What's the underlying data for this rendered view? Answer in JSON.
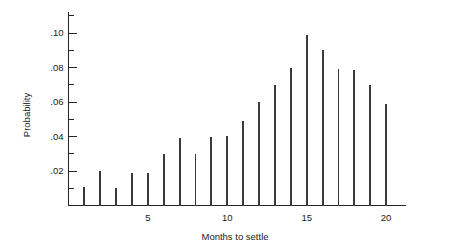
{
  "chart_data": {
    "type": "bar",
    "title": "",
    "subtitle": "",
    "xlabel": "Months to settle",
    "ylabel": "Probability",
    "categories": [
      1,
      2,
      3,
      4,
      5,
      6,
      7,
      8,
      9,
      10,
      11,
      12,
      13,
      14,
      15,
      16,
      17,
      18,
      19,
      20
    ],
    "values": [
      0.011,
      0.02,
      0.01,
      0.019,
      0.019,
      0.03,
      0.039,
      0.03,
      0.04,
      0.0405,
      0.049,
      0.06,
      0.07,
      0.08,
      0.099,
      0.09,
      0.079,
      0.0785,
      0.07,
      0.059
    ],
    "xlim": [
      0.3,
      21.2
    ],
    "ylim": [
      0,
      0.112
    ],
    "xticks": [
      1,
      2,
      3,
      4,
      5,
      6,
      7,
      8,
      9,
      10,
      11,
      12,
      13,
      14,
      15,
      16,
      17,
      18,
      19,
      20
    ],
    "xtick_labels": [
      {
        "value": 5,
        "label": "5"
      },
      {
        "value": 10,
        "label": "10"
      },
      {
        "value": 15,
        "label": "15"
      },
      {
        "value": 20,
        "label": "20"
      }
    ],
    "yticks_major": [
      {
        "value": 0.02,
        "label": ".02"
      },
      {
        "value": 0.04,
        "label": ".04"
      },
      {
        "value": 0.06,
        "label": ".06"
      },
      {
        "value": 0.08,
        "label": ".08"
      },
      {
        "value": 0.1,
        "label": ".10"
      }
    ],
    "yticks_minor": [
      0.01,
      0.03,
      0.05,
      0.07,
      0.09,
      0.11
    ],
    "grid": false,
    "legend": null,
    "colors": {
      "stem": "#3a3a3a",
      "axis": "#262626",
      "background": "#ffffff",
      "text": "#1a1a1a"
    }
  }
}
